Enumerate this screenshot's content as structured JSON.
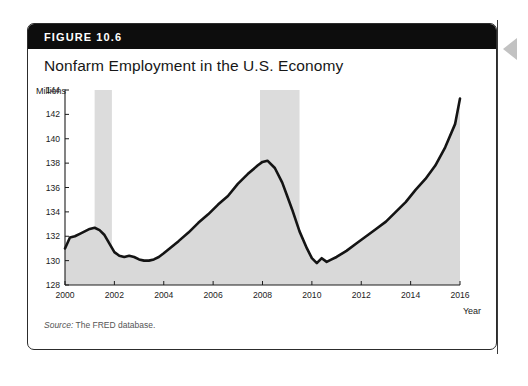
{
  "figure": {
    "number_label": "FIGURE 10.6",
    "title": "Nonfarm Employment in the U.S. Economy",
    "source_prefix": "Source:",
    "source_text": " The FRED database."
  },
  "colors": {
    "header_bg": "#0d0d0d",
    "card_border": "#2c2c2c",
    "line": "#141414",
    "area_fill": "#d9d9d9",
    "recession_band": "#dcdcdc",
    "arrow": "#c2c2c2"
  },
  "chart_data": {
    "type": "line",
    "title": "Nonfarm Employment in the U.S. Economy",
    "xlabel": "Year",
    "ylabel": "Millions",
    "ylim": [
      128,
      144
    ],
    "xlim": [
      2000,
      2016
    ],
    "ytick_labels": [
      "128",
      "130",
      "132",
      "134",
      "136",
      "138",
      "140",
      "142",
      "144"
    ],
    "yticks": [
      128,
      130,
      132,
      134,
      136,
      138,
      140,
      142,
      144
    ],
    "xtick_labels": [
      "2000",
      "2002",
      "2004",
      "2006",
      "2008",
      "2010",
      "2012",
      "2014",
      "2016"
    ],
    "xticks": [
      2000,
      2002,
      2004,
      2006,
      2008,
      2010,
      2012,
      2014,
      2016
    ],
    "grid": false,
    "legend": "none",
    "series": [
      {
        "name": "Nonfarm Employment",
        "units": "millions of persons",
        "x": [
          2000.0,
          2000.2,
          2000.4,
          2000.6,
          2000.8,
          2001.0,
          2001.2,
          2001.4,
          2001.6,
          2001.8,
          2002.0,
          2002.2,
          2002.4,
          2002.6,
          2002.8,
          2003.0,
          2003.2,
          2003.4,
          2003.6,
          2003.8,
          2004.0,
          2004.3,
          2004.6,
          2005.0,
          2005.4,
          2005.8,
          2006.2,
          2006.6,
          2007.0,
          2007.4,
          2007.8,
          2008.0,
          2008.2,
          2008.5,
          2008.8,
          2009.0,
          2009.2,
          2009.5,
          2009.8,
          2010.0,
          2010.2,
          2010.4,
          2010.6,
          2010.8,
          2011.0,
          2011.4,
          2011.8,
          2012.2,
          2012.6,
          2013.0,
          2013.4,
          2013.8,
          2014.2,
          2014.6,
          2015.0,
          2015.4,
          2015.8,
          2016.0
        ],
        "values": [
          131.0,
          131.9,
          132.0,
          132.2,
          132.4,
          132.6,
          132.7,
          132.5,
          132.1,
          131.4,
          130.7,
          130.4,
          130.3,
          130.4,
          130.3,
          130.1,
          130.0,
          130.0,
          130.1,
          130.3,
          130.6,
          131.1,
          131.6,
          132.3,
          133.1,
          133.8,
          134.6,
          135.3,
          136.3,
          137.1,
          137.8,
          138.1,
          138.2,
          137.6,
          136.4,
          135.3,
          134.2,
          132.4,
          131.0,
          130.2,
          129.8,
          130.2,
          129.9,
          130.1,
          130.3,
          130.8,
          131.4,
          132.0,
          132.6,
          133.2,
          134.0,
          134.8,
          135.8,
          136.7,
          137.8,
          139.3,
          141.2,
          143.3
        ]
      }
    ],
    "recession_bands": [
      {
        "start": 2001.2,
        "end": 2001.9
      },
      {
        "start": 2007.9,
        "end": 2009.5
      }
    ]
  }
}
